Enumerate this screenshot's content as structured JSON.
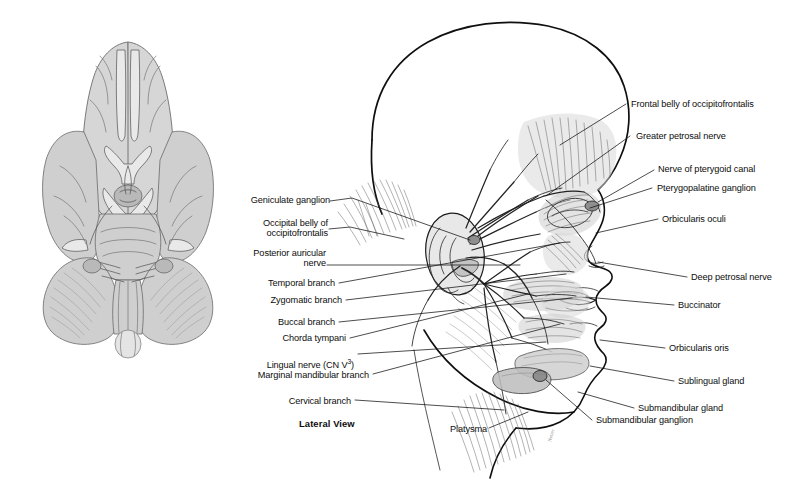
{
  "plate": {
    "view_caption": "Lateral View",
    "figures": {
      "brain_inferior": "inferior-view-of-brain-and-brainstem",
      "head_lateral": "lateral-view-of-head-facial-nerve-distribution"
    },
    "artist_signature": "Netter"
  },
  "labels_left": [
    {
      "id": "geniculate-ganglion",
      "text": "Geniculate ganglion"
    },
    {
      "id": "occipital-belly-line1",
      "text": "Occipital belly of"
    },
    {
      "id": "occipital-belly-line2",
      "text": "occipitofrontalis"
    },
    {
      "id": "posterior-auricular-line1",
      "text": "Posterior auricular"
    },
    {
      "id": "posterior-auricular-line2",
      "text": "nerve"
    },
    {
      "id": "temporal-branch",
      "text": "Temporal branch"
    },
    {
      "id": "zygomatic-branch",
      "text": "Zygomatic branch"
    },
    {
      "id": "buccal-branch",
      "text": "Buccal branch"
    },
    {
      "id": "chorda-tympani",
      "text": "Chorda tympani"
    },
    {
      "id": "lingual-nerve",
      "text": "Lingual nerve (CN V",
      "sup": "3",
      "suffix": ")"
    },
    {
      "id": "marginal-mandibular-branch",
      "text": "Marginal mandibular branch"
    },
    {
      "id": "cervical-branch",
      "text": "Cervical branch"
    }
  ],
  "labels_right": [
    {
      "id": "frontal-belly-occipitofrontalis",
      "text": "Frontal belly of occipitofrontalis"
    },
    {
      "id": "greater-petrosal-nerve",
      "text": "Greater petrosal nerve"
    },
    {
      "id": "nerve-of-pterygoid-canal",
      "text": "Nerve of pterygoid canal"
    },
    {
      "id": "pterygopalatine-ganglion",
      "text": "Pterygopalatine ganglion"
    },
    {
      "id": "orbicularis-oculi",
      "text": "Orbicularis oculi"
    },
    {
      "id": "deep-petrosal-nerve",
      "text": "Deep petrosal nerve"
    },
    {
      "id": "buccinator",
      "text": "Buccinator"
    },
    {
      "id": "orbicularis-oris",
      "text": "Orbicularis oris"
    },
    {
      "id": "sublingual-gland",
      "text": "Sublingual gland"
    },
    {
      "id": "submandibular-gland",
      "text": "Submandibular gland"
    },
    {
      "id": "submandibular-ganglion",
      "text": "Submandibular ganglion"
    }
  ],
  "labels_inline": [
    {
      "id": "platysma",
      "text": "Platysma"
    }
  ],
  "colors": {
    "background": "#ffffff",
    "ink": "#111111",
    "wash_gray": "#d9d9d9",
    "mid_gray": "#8e8e8e"
  }
}
